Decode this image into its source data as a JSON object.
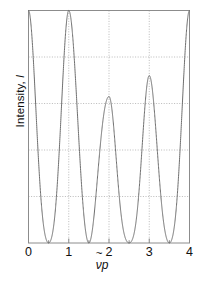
{
  "axes": {
    "y_title": "Intensity, I",
    "y_title_prefix": "Intensity, ",
    "y_title_symbol": "I",
    "x_title": "ν̃p",
    "x_symbol_nu": "ν",
    "x_symbol_p": "p"
  },
  "chart_data": {
    "type": "line",
    "title": "",
    "xlabel": "ν̃p",
    "ylabel": "Intensity, I",
    "xlim": [
      0,
      4
    ],
    "ylim": [
      0,
      1
    ],
    "xticks": [
      0,
      1,
      2,
      3,
      4
    ],
    "xticklabels": [
      "0",
      "1",
      "2",
      "3",
      "4"
    ],
    "xminorticks": [
      0.5,
      1.5,
      2.5,
      3.5
    ],
    "yticks": [
      0.2,
      0.4,
      0.6,
      0.8
    ],
    "yticklabels": [
      "",
      "",
      "",
      ""
    ],
    "grid": true,
    "grid_style": "dotted",
    "vertical_gridlines": [
      1,
      2,
      3
    ],
    "legend": null,
    "line_color": "#6e6e6e",
    "series": [
      {
        "name": "interferogram",
        "description": "Two-component cosine interferogram: I = 0.5*(1+cos(2*pi*x)) * envelope(x)",
        "peaks_x": [
          0.0,
          0.5,
          1.0,
          1.5,
          2.0,
          2.5,
          3.0,
          3.5,
          4.0
        ],
        "peaks_y": [
          1.0,
          0.41,
          1.0,
          0.79,
          0.63,
          0.21,
          0.72,
          0.41,
          1.0
        ],
        "minima_x": [
          0.25,
          0.75,
          1.25,
          1.75,
          2.25,
          2.75,
          3.25,
          3.75
        ],
        "minima_y": [
          0.0,
          0.0,
          0.0,
          0.0,
          0.0,
          0.0,
          0.0,
          0.0
        ],
        "period": 0.5
      }
    ]
  },
  "colors": {
    "curve": "#6e6e6e",
    "frame": "#8c8c8c",
    "grid": "#a8a8a8",
    "text": "#111111",
    "background": "#ffffff"
  }
}
